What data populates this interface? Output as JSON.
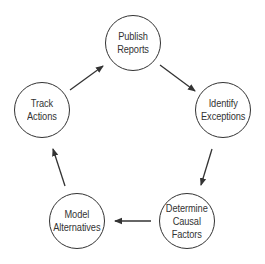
{
  "diagram": {
    "type": "cycle",
    "nodes": [
      {
        "id": "publish",
        "label": "Publish\nReports",
        "cx": 133,
        "cy": 43
      },
      {
        "id": "identify",
        "label": "Identify\nExceptions",
        "cx": 223,
        "cy": 110
      },
      {
        "id": "determine",
        "label": "Determine\nCausal\nFactors",
        "cx": 187,
        "cy": 221
      },
      {
        "id": "model",
        "label": "Model\nAlternatives",
        "cx": 77,
        "cy": 221
      },
      {
        "id": "track",
        "label": "Track\nActions",
        "cx": 42,
        "cy": 110
      }
    ],
    "edges": [
      {
        "from": "track",
        "to": "publish"
      },
      {
        "from": "publish",
        "to": "identify"
      },
      {
        "from": "identify",
        "to": "determine"
      },
      {
        "from": "determine",
        "to": "model"
      },
      {
        "from": "model",
        "to": "track"
      }
    ],
    "colors": {
      "stroke": "#333333",
      "background": "#ffffff"
    }
  }
}
